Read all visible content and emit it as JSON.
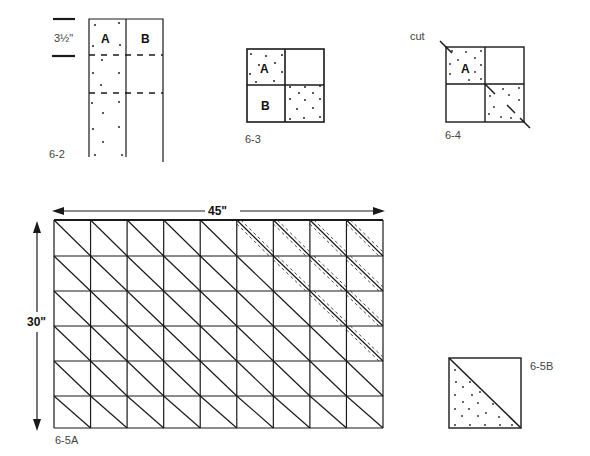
{
  "figures": {
    "fig_6_2": {
      "label": "6-2",
      "measure": "3½\"",
      "strip_a": "A",
      "strip_b": "B"
    },
    "fig_6_3": {
      "label": "6-3",
      "square_a": "A",
      "square_b": "B"
    },
    "fig_6_4": {
      "label": "6-4",
      "cut_label": "cut",
      "square_a": "A"
    },
    "fig_6_5A": {
      "label": "6-5A",
      "width_label": "45\"",
      "height_label": "30\"",
      "columns": 9,
      "rows": 6,
      "seam_cells": [
        [
          0,
          5
        ],
        [
          0,
          6
        ],
        [
          0,
          7
        ],
        [
          0,
          8
        ],
        [
          1,
          6
        ],
        [
          1,
          7
        ],
        [
          1,
          8
        ],
        [
          2,
          7
        ],
        [
          2,
          8
        ],
        [
          3,
          8
        ]
      ]
    },
    "fig_6_5B": {
      "label": "6-5B"
    }
  },
  "colors": {
    "ink": "#1a1a1a",
    "paper": "#ffffff",
    "caption": "#444444"
  }
}
